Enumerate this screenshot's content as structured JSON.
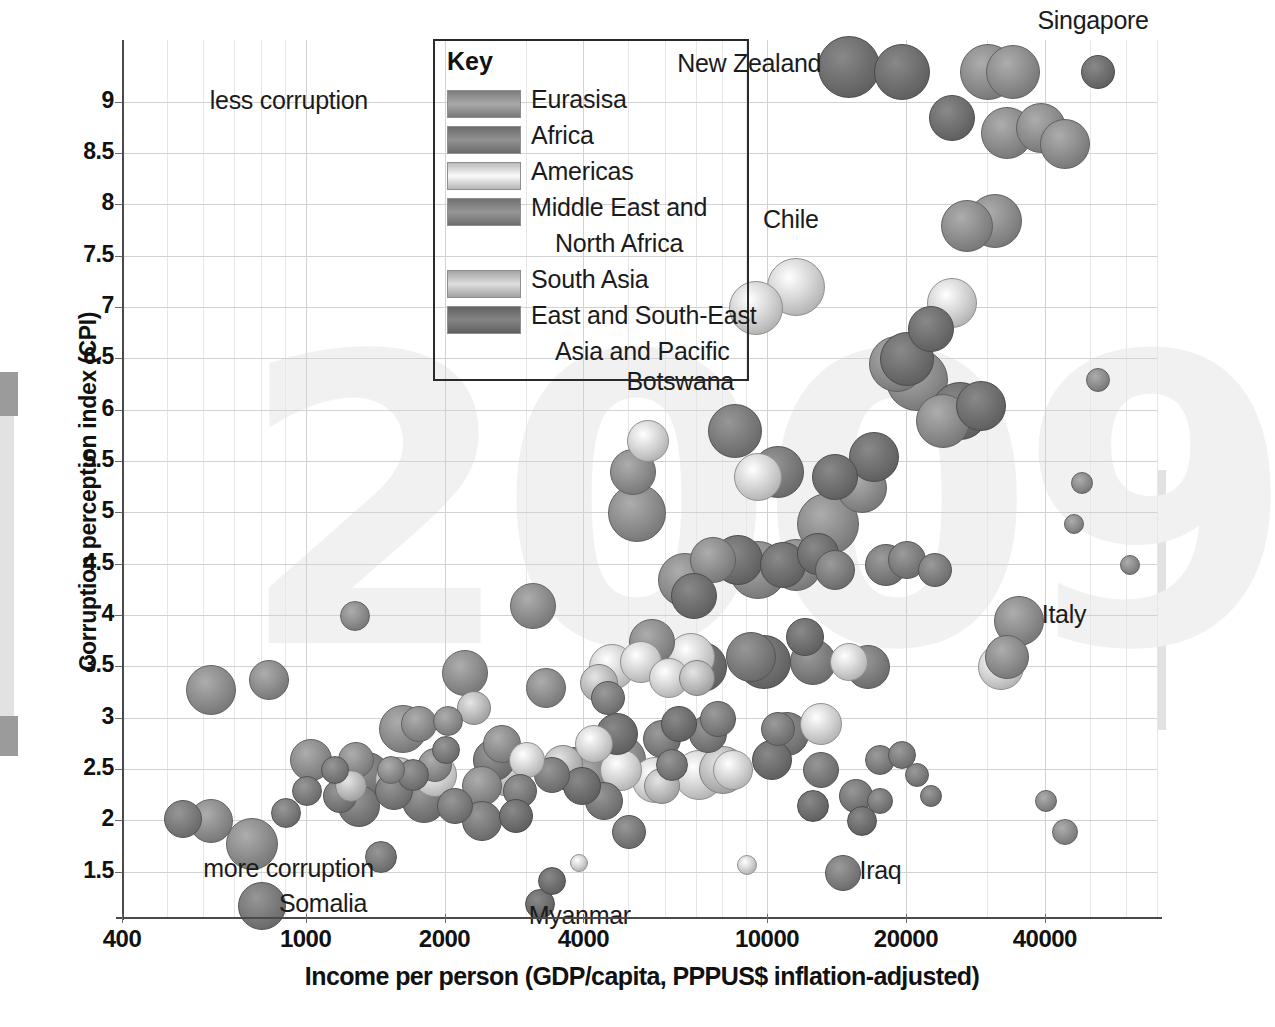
{
  "chart_data": {
    "type": "scatter",
    "title": "",
    "xlabel": "Income per person (GDP/capita, PPPUS$ inflation-adjusted)",
    "ylabel": "Corruption perception index (CPI)",
    "xscale": "log",
    "xlim": [
      400,
      70000
    ],
    "ylim": [
      1.05,
      9.6
    ],
    "xticks": [
      "400",
      "1000",
      "2000",
      "4000",
      "10000",
      "20000",
      "40000"
    ],
    "xtick_values": [
      400,
      1000,
      2000,
      4000,
      10000,
      20000,
      40000
    ],
    "yticks": [
      "1.5",
      "2",
      "2.5",
      "3",
      "3.5",
      "4",
      "4.5",
      "5",
      "5.5",
      "6",
      "6.5",
      "7",
      "7.5",
      "8",
      "8.5",
      "9"
    ],
    "ytick_values": [
      1.5,
      2,
      2.5,
      3,
      3.5,
      4,
      4.5,
      5,
      5.5,
      6,
      6.5,
      7,
      7.5,
      8,
      8.5,
      9
    ],
    "grid": true,
    "watermark": "2009",
    "legend_position": "top-center",
    "bubble_size_meaning": "population",
    "annotations": [
      {
        "label": "less corruption",
        "x": 620,
        "y": 9.0
      },
      {
        "label": "more corruption",
        "x": 600,
        "y": 1.52
      },
      {
        "label": "Somalia",
        "x": 800,
        "y": 1.18
      },
      {
        "label": "Myanmar",
        "x": 3200,
        "y": 1.18
      },
      {
        "label": "Iraq",
        "x": 14500,
        "y": 1.5
      },
      {
        "label": "Botswana",
        "x": 8500,
        "y": 6.05
      },
      {
        "label": "Chile",
        "x": 11500,
        "y": 7.55
      },
      {
        "label": "Italy",
        "x": 36000,
        "y": 3.95
      },
      {
        "label": "New Zealand",
        "x": 13500,
        "y": 9.3
      },
      {
        "label": "Singapore",
        "x": 52000,
        "y": 9.6
      }
    ],
    "series": [
      {
        "name": "Eurasisa",
        "color": "#8e8e8e",
        "points": [
          {
            "x": 620,
            "y": 2.0,
            "r": 21
          },
          {
            "x": 760,
            "y": 1.78,
            "r": 25
          },
          {
            "x": 1270,
            "y": 4.0,
            "r": 14
          },
          {
            "x": 620,
            "y": 3.28,
            "r": 24
          },
          {
            "x": 830,
            "y": 3.38,
            "r": 19
          },
          {
            "x": 1020,
            "y": 2.6,
            "r": 20
          },
          {
            "x": 1280,
            "y": 2.6,
            "r": 17
          },
          {
            "x": 1520,
            "y": 2.5,
            "r": 13
          },
          {
            "x": 1750,
            "y": 2.95,
            "r": 17
          },
          {
            "x": 2020,
            "y": 2.98,
            "r": 14
          },
          {
            "x": 1620,
            "y": 2.9,
            "r": 23
          },
          {
            "x": 1900,
            "y": 2.55,
            "r": 16
          },
          {
            "x": 2200,
            "y": 3.45,
            "r": 22
          },
          {
            "x": 2650,
            "y": 2.75,
            "r": 18
          },
          {
            "x": 3100,
            "y": 4.1,
            "r": 22
          },
          {
            "x": 3300,
            "y": 3.3,
            "r": 19
          },
          {
            "x": 2400,
            "y": 2.35,
            "r": 19
          },
          {
            "x": 4100,
            "y": 2.45,
            "r": 20
          },
          {
            "x": 4800,
            "y": 2.6,
            "r": 24
          },
          {
            "x": 5600,
            "y": 3.75,
            "r": 22
          },
          {
            "x": 5200,
            "y": 5.0,
            "r": 28
          },
          {
            "x": 5100,
            "y": 5.4,
            "r": 22
          },
          {
            "x": 6600,
            "y": 4.35,
            "r": 26
          },
          {
            "x": 7600,
            "y": 4.55,
            "r": 22
          },
          {
            "x": 9500,
            "y": 4.45,
            "r": 28
          },
          {
            "x": 11500,
            "y": 4.5,
            "r": 25
          },
          {
            "x": 13500,
            "y": 4.9,
            "r": 30
          },
          {
            "x": 16000,
            "y": 5.25,
            "r": 24
          },
          {
            "x": 19000,
            "y": 6.45,
            "r": 27
          },
          {
            "x": 21000,
            "y": 6.3,
            "r": 30
          },
          {
            "x": 24000,
            "y": 5.9,
            "r": 26
          },
          {
            "x": 27000,
            "y": 7.8,
            "r": 25
          },
          {
            "x": 31000,
            "y": 7.85,
            "r": 26
          },
          {
            "x": 30000,
            "y": 9.3,
            "r": 27
          },
          {
            "x": 34000,
            "y": 9.3,
            "r": 26
          },
          {
            "x": 33000,
            "y": 8.7,
            "r": 25
          },
          {
            "x": 39000,
            "y": 8.75,
            "r": 24
          },
          {
            "x": 44000,
            "y": 8.6,
            "r": 24
          },
          {
            "x": 35000,
            "y": 3.95,
            "r": 24
          },
          {
            "x": 33000,
            "y": 3.6,
            "r": 21
          },
          {
            "x": 52000,
            "y": 6.3,
            "r": 11
          },
          {
            "x": 48000,
            "y": 5.3,
            "r": 10
          },
          {
            "x": 46000,
            "y": 4.9,
            "r": 9
          },
          {
            "x": 61000,
            "y": 4.5,
            "r": 9
          },
          {
            "x": 40000,
            "y": 2.2,
            "r": 10
          },
          {
            "x": 44000,
            "y": 1.9,
            "r": 12
          }
        ]
      },
      {
        "name": "Africa",
        "color": "#7c7c7c",
        "points": [
          {
            "x": 800,
            "y": 1.18,
            "r": 23
          },
          {
            "x": 540,
            "y": 2.02,
            "r": 18
          },
          {
            "x": 900,
            "y": 2.08,
            "r": 14
          },
          {
            "x": 1450,
            "y": 1.65,
            "r": 15
          },
          {
            "x": 1300,
            "y": 2.15,
            "r": 20
          },
          {
            "x": 1550,
            "y": 2.3,
            "r": 18
          },
          {
            "x": 1800,
            "y": 2.2,
            "r": 21
          },
          {
            "x": 2100,
            "y": 2.15,
            "r": 17
          },
          {
            "x": 2400,
            "y": 2.0,
            "r": 19
          },
          {
            "x": 2900,
            "y": 2.3,
            "r": 16
          },
          {
            "x": 1150,
            "y": 2.5,
            "r": 13
          },
          {
            "x": 1350,
            "y": 2.45,
            "r": 22
          },
          {
            "x": 1700,
            "y": 2.45,
            "r": 15
          },
          {
            "x": 2000,
            "y": 2.7,
            "r": 13
          },
          {
            "x": 2550,
            "y": 2.6,
            "r": 20
          },
          {
            "x": 3400,
            "y": 2.45,
            "r": 17
          },
          {
            "x": 3800,
            "y": 2.5,
            "r": 22
          },
          {
            "x": 4400,
            "y": 2.2,
            "r": 18
          },
          {
            "x": 5000,
            "y": 1.9,
            "r": 16
          },
          {
            "x": 6200,
            "y": 2.55,
            "r": 15
          },
          {
            "x": 8500,
            "y": 5.8,
            "r": 26
          },
          {
            "x": 10500,
            "y": 5.4,
            "r": 25
          },
          {
            "x": 9200,
            "y": 3.6,
            "r": 24
          },
          {
            "x": 7400,
            "y": 2.85,
            "r": 18
          },
          {
            "x": 11000,
            "y": 2.85,
            "r": 21
          },
          {
            "x": 13000,
            "y": 2.5,
            "r": 17
          },
          {
            "x": 15500,
            "y": 2.25,
            "r": 16
          },
          {
            "x": 17500,
            "y": 2.2,
            "r": 12
          },
          {
            "x": 1000,
            "y": 2.3,
            "r": 14
          },
          {
            "x": 1180,
            "y": 2.25,
            "r": 16
          }
        ]
      },
      {
        "name": "Americas",
        "color": "#d4d4d4",
        "points": [
          {
            "x": 11500,
            "y": 7.2,
            "r": 28
          },
          {
            "x": 9400,
            "y": 7.0,
            "r": 26
          },
          {
            "x": 9500,
            "y": 5.35,
            "r": 23
          },
          {
            "x": 5500,
            "y": 5.7,
            "r": 20
          },
          {
            "x": 4600,
            "y": 3.5,
            "r": 22
          },
          {
            "x": 5300,
            "y": 3.55,
            "r": 20
          },
          {
            "x": 6100,
            "y": 3.4,
            "r": 19
          },
          {
            "x": 6800,
            "y": 3.6,
            "r": 23
          },
          {
            "x": 4200,
            "y": 2.75,
            "r": 18
          },
          {
            "x": 4800,
            "y": 2.5,
            "r": 20
          },
          {
            "x": 5700,
            "y": 2.4,
            "r": 22
          },
          {
            "x": 7100,
            "y": 2.45,
            "r": 24
          },
          {
            "x": 8400,
            "y": 2.5,
            "r": 19
          },
          {
            "x": 1900,
            "y": 2.45,
            "r": 21
          },
          {
            "x": 3000,
            "y": 2.6,
            "r": 17
          },
          {
            "x": 9000,
            "y": 1.58,
            "r": 9
          },
          {
            "x": 15000,
            "y": 3.55,
            "r": 18
          },
          {
            "x": 13000,
            "y": 2.95,
            "r": 20
          },
          {
            "x": 32000,
            "y": 3.5,
            "r": 22
          },
          {
            "x": 25000,
            "y": 7.05,
            "r": 24
          },
          {
            "x": 3900,
            "y": 1.6,
            "r": 8
          }
        ]
      },
      {
        "name": "Middle East and North Africa",
        "color": "#7f7f7f",
        "points": [
          {
            "x": 14500,
            "y": 1.5,
            "r": 17
          },
          {
            "x": 4500,
            "y": 3.2,
            "r": 16
          },
          {
            "x": 5900,
            "y": 2.8,
            "r": 18
          },
          {
            "x": 7800,
            "y": 3.0,
            "r": 17
          },
          {
            "x": 10500,
            "y": 2.9,
            "r": 16
          },
          {
            "x": 12500,
            "y": 3.55,
            "r": 22
          },
          {
            "x": 16500,
            "y": 3.5,
            "r": 21
          },
          {
            "x": 17500,
            "y": 2.6,
            "r": 14
          },
          {
            "x": 19500,
            "y": 2.65,
            "r": 13
          },
          {
            "x": 21000,
            "y": 2.45,
            "r": 11
          },
          {
            "x": 22500,
            "y": 2.25,
            "r": 10
          },
          {
            "x": 18000,
            "y": 4.5,
            "r": 20
          },
          {
            "x": 20000,
            "y": 4.55,
            "r": 18
          },
          {
            "x": 23000,
            "y": 4.45,
            "r": 16
          },
          {
            "x": 14000,
            "y": 4.45,
            "r": 19
          }
        ]
      },
      {
        "name": "South Asia",
        "color": "#bcbcbc",
        "points": [
          {
            "x": 1580,
            "y": 2.4,
            "r": 22
          },
          {
            "x": 2750,
            "y": 2.45,
            "r": 21
          },
          {
            "x": 3600,
            "y": 2.55,
            "r": 19
          },
          {
            "x": 2300,
            "y": 3.1,
            "r": 16
          },
          {
            "x": 4300,
            "y": 3.35,
            "r": 18
          },
          {
            "x": 7000,
            "y": 3.4,
            "r": 17
          },
          {
            "x": 8000,
            "y": 2.5,
            "r": 23
          },
          {
            "x": 5900,
            "y": 2.35,
            "r": 17
          },
          {
            "x": 1250,
            "y": 2.35,
            "r": 15
          }
        ]
      },
      {
        "name": "East and South-East Asia and Pacific",
        "color": "#707070",
        "points": [
          {
            "x": 3200,
            "y": 1.2,
            "r": 14
          },
          {
            "x": 3400,
            "y": 1.42,
            "r": 13
          },
          {
            "x": 2850,
            "y": 2.05,
            "r": 16
          },
          {
            "x": 3950,
            "y": 2.35,
            "r": 18
          },
          {
            "x": 4700,
            "y": 2.85,
            "r": 20
          },
          {
            "x": 6400,
            "y": 2.95,
            "r": 17
          },
          {
            "x": 7200,
            "y": 3.5,
            "r": 24
          },
          {
            "x": 9800,
            "y": 3.55,
            "r": 26
          },
          {
            "x": 12000,
            "y": 3.8,
            "r": 18
          },
          {
            "x": 6900,
            "y": 4.2,
            "r": 22
          },
          {
            "x": 8600,
            "y": 4.55,
            "r": 24
          },
          {
            "x": 10800,
            "y": 4.5,
            "r": 22
          },
          {
            "x": 12800,
            "y": 4.6,
            "r": 20
          },
          {
            "x": 14000,
            "y": 5.35,
            "r": 22
          },
          {
            "x": 17000,
            "y": 5.55,
            "r": 24
          },
          {
            "x": 20000,
            "y": 6.5,
            "r": 26
          },
          {
            "x": 22500,
            "y": 6.8,
            "r": 22
          },
          {
            "x": 26000,
            "y": 6.0,
            "r": 28
          },
          {
            "x": 29000,
            "y": 6.05,
            "r": 24
          },
          {
            "x": 15000,
            "y": 9.35,
            "r": 30
          },
          {
            "x": 19500,
            "y": 9.3,
            "r": 27
          },
          {
            "x": 52000,
            "y": 9.3,
            "r": 16
          },
          {
            "x": 25000,
            "y": 8.85,
            "r": 22
          },
          {
            "x": 10200,
            "y": 2.6,
            "r": 19
          },
          {
            "x": 12500,
            "y": 2.15,
            "r": 15
          },
          {
            "x": 16000,
            "y": 2.0,
            "r": 14
          }
        ]
      }
    ]
  },
  "legend": {
    "title": "Key",
    "entries": [
      {
        "label": "Eurasisa",
        "color": "#8e8e8e",
        "cont": ""
      },
      {
        "label": "Africa",
        "color": "#7c7c7c",
        "cont": ""
      },
      {
        "label": "Americas",
        "color": "#d4d4d4",
        "cont": ""
      },
      {
        "label": "Middle East and",
        "color": "#7f7f7f",
        "cont": "North Africa"
      },
      {
        "label": "South Asia",
        "color": "#bcbcbc",
        "cont": ""
      },
      {
        "label": "East and South-East",
        "color": "#707070",
        "cont": "Asia and Pacific"
      }
    ]
  }
}
